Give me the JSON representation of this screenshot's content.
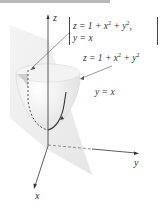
{
  "figure": {
    "axes": {
      "x_label": "x",
      "y_label": "y",
      "z_label": "z"
    },
    "system": {
      "line1_pre": "z = 1 + x",
      "line1_mid": " + y",
      "line1_post": ",",
      "line2": "y = x"
    },
    "surface_label": {
      "pre": "z = 1 + x",
      "mid": " + y",
      "post": ""
    },
    "plane_label": "y = x",
    "exponent": "2"
  }
}
